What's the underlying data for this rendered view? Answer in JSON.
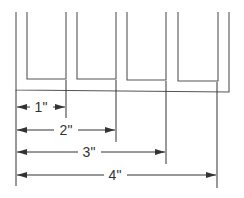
{
  "diagram": {
    "title": "",
    "colors": {
      "outline": "#555555",
      "dimension": "#333333",
      "background": "#ffffff"
    },
    "dimensions": [
      {
        "label": "1\"",
        "value_in": 1
      },
      {
        "label": "2\"",
        "value_in": 2
      },
      {
        "label": "3\"",
        "value_in": 3
      },
      {
        "label": "4\"",
        "value_in": 4
      }
    ],
    "channel_count": 4
  }
}
